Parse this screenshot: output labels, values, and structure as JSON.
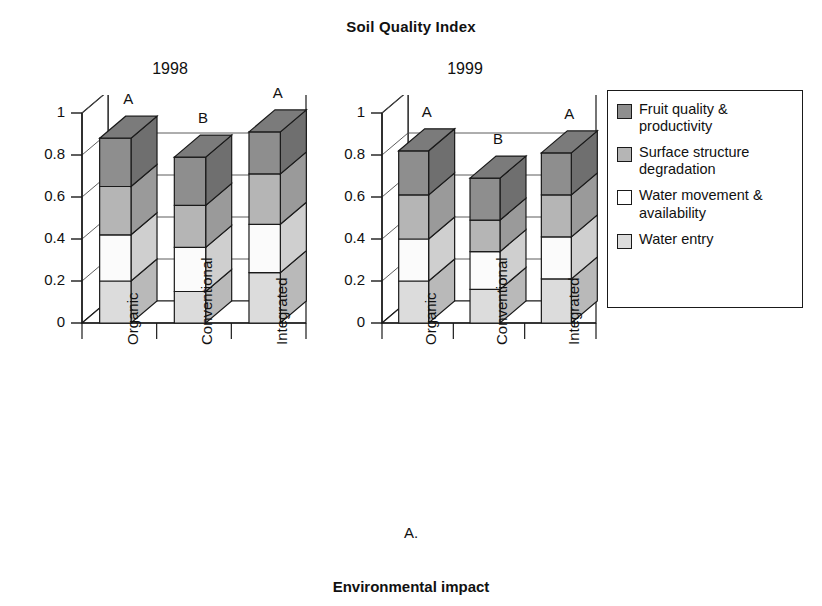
{
  "title": "Soil Quality Index",
  "panel_letter": "A.",
  "bottom_caption": "Environmental impact",
  "panels": [
    {
      "label": "1998"
    },
    {
      "label": "1999"
    }
  ],
  "legend": {
    "items": [
      {
        "label": "Fruit quality & productivity",
        "color": "#8e8e8e"
      },
      {
        "label": "Surface structure degradation",
        "color": "#b5b5b5"
      },
      {
        "label": "Water movement & availability",
        "color": "#ffffff"
      },
      {
        "label": "Water entry",
        "color": "#dcdcdc"
      }
    ]
  },
  "axis": {
    "yticks": [
      "0",
      "0.2",
      "0.4",
      "0.6",
      "0.8",
      "1"
    ],
    "ylim": [
      0,
      1
    ],
    "categories": [
      "Organic",
      "Conventional",
      "Integrated"
    ]
  },
  "chart_data": {
    "type": "bar",
    "subtype": "stacked-3d",
    "title": "Soil Quality Index",
    "xlabel": "",
    "ylabel": "",
    "ylim": [
      0,
      1
    ],
    "ytick_labels": [
      "0",
      "0.2",
      "0.4",
      "0.6",
      "0.8",
      "1"
    ],
    "grid": true,
    "legend_position": "right",
    "categories": [
      "Organic",
      "Conventional",
      "Integrated"
    ],
    "panels": [
      {
        "name": "1998",
        "significance_letters": [
          "A",
          "B",
          "A"
        ],
        "totals": [
          0.88,
          0.79,
          0.91
        ],
        "series": [
          {
            "name": "Water entry",
            "values": [
              0.2,
              0.15,
              0.24
            ]
          },
          {
            "name": "Water movement & availability",
            "values": [
              0.22,
              0.21,
              0.23
            ]
          },
          {
            "name": "Surface structure degradation",
            "values": [
              0.23,
              0.2,
              0.24
            ]
          },
          {
            "name": "Fruit quality & productivity",
            "values": [
              0.23,
              0.23,
              0.2
            ]
          }
        ],
        "cumulative": [
          [
            0.2,
            0.42,
            0.65,
            0.88
          ],
          [
            0.15,
            0.36,
            0.56,
            0.79
          ],
          [
            0.24,
            0.47,
            0.71,
            0.91
          ]
        ]
      },
      {
        "name": "1999",
        "significance_letters": [
          "A",
          "B",
          "A"
        ],
        "totals": [
          0.82,
          0.69,
          0.81
        ],
        "series": [
          {
            "name": "Water entry",
            "values": [
              0.2,
              0.16,
              0.21
            ]
          },
          {
            "name": "Water movement & availability",
            "values": [
              0.2,
              0.18,
              0.2
            ]
          },
          {
            "name": "Surface structure degradation",
            "values": [
              0.21,
              0.15,
              0.2
            ]
          },
          {
            "name": "Fruit quality & productivity",
            "values": [
              0.21,
              0.2,
              0.2
            ]
          }
        ],
        "cumulative": [
          [
            0.2,
            0.4,
            0.61,
            0.82
          ],
          [
            0.16,
            0.34,
            0.49,
            0.69
          ],
          [
            0.21,
            0.41,
            0.61,
            0.81
          ]
        ]
      }
    ]
  }
}
